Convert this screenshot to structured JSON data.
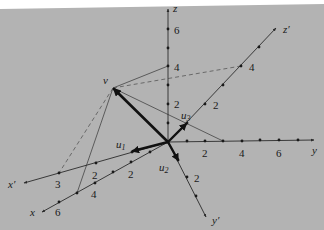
{
  "diagram": {
    "colors": {
      "background": "#b3b3b3",
      "axis": "#2a2a2a",
      "vector": "#111111",
      "construction": "#444444",
      "dashed": "#555555"
    },
    "origin": {
      "x": 168,
      "y": 142
    },
    "axes": [
      {
        "id": "z",
        "label": "z",
        "end": [
          168,
          9
        ],
        "ticks": [
          {
            "at": [
              168,
              104
            ],
            "label": "2"
          },
          {
            "at": [
              168,
              66
            ],
            "label": "4"
          },
          {
            "at": [
              168,
              29
            ],
            "label": "6"
          }
        ],
        "minor": [
          [
            168,
            123
          ],
          [
            168,
            85
          ],
          [
            168,
            48
          ]
        ]
      },
      {
        "id": "y",
        "label": "y",
        "end": [
          314,
          140
        ],
        "ticks": [
          {
            "at": [
              205,
              141
            ],
            "label": "2"
          },
          {
            "at": [
              242,
              141
            ],
            "label": "4"
          },
          {
            "at": [
              279,
              140
            ],
            "label": "6"
          }
        ],
        "minor": [
          [
            187,
            141
          ],
          [
            223,
            141
          ],
          [
            260,
            140
          ],
          [
            298,
            140
          ]
        ]
      },
      {
        "id": "x",
        "label": "x",
        "end": [
          42,
          212
        ],
        "ticks": [
          {
            "at": [
              131,
              162
            ],
            "label": "2"
          },
          {
            "at": [
              95,
              183
            ],
            "label": "4"
          },
          {
            "at": [
              59,
              202
            ],
            "label": "6"
          }
        ],
        "minor": [
          [
            150,
            152
          ],
          [
            113,
            172
          ],
          [
            77,
            193
          ]
        ]
      },
      {
        "id": "xp",
        "label": "x′",
        "end": [
          24,
          183
        ],
        "ticks": [
          {
            "at": [
              96,
              163
            ],
            "label": "2"
          },
          {
            "at": [
              59,
              173
            ],
            "label": "3"
          }
        ],
        "minor": [
          [
            132,
            152
          ]
        ]
      },
      {
        "id": "yp",
        "label": "y′",
        "end": [
          206,
          217
        ],
        "ticks": [
          {
            "at": [
              187,
              177
            ],
            "label": "2"
          }
        ],
        "minor": [
          [
            178,
            160
          ],
          [
            196,
            196
          ]
        ]
      },
      {
        "id": "zp",
        "label": "z′",
        "end": [
          276,
          28
        ],
        "ticks": [
          {
            "at": [
              205,
              104
            ],
            "label": "2"
          },
          {
            "at": [
              241,
              66
            ],
            "label": "4"
          }
        ],
        "minor": [
          [
            187,
            123
          ],
          [
            223,
            85
          ],
          [
            259,
            47
          ]
        ]
      }
    ],
    "vectors": {
      "v": {
        "label": "v",
        "tip": [
          113,
          88
        ]
      },
      "u1": {
        "label": "u",
        "sub": "1",
        "tip": [
          131,
          151
        ]
      },
      "u2": {
        "label": "u",
        "sub": "2",
        "tip": [
          178,
          161
        ]
      },
      "u3": {
        "label": "u",
        "sub": "3",
        "tip": [
          187,
          123
        ]
      }
    },
    "labels": {
      "v": "v",
      "u": "u",
      "u1_sub": "1",
      "u2_sub": "2",
      "u3_sub": "3",
      "z": "z",
      "y": "y",
      "x": "x",
      "xp": "x′",
      "yp": "y′",
      "zp": "z′",
      "z_2": "2",
      "z_4": "4",
      "z_6": "6",
      "y_2": "2",
      "y_4": "4",
      "y_6": "6",
      "x_2": "2",
      "x_4": "4",
      "x_6": "6",
      "xp_2": "2",
      "xp_3": "3",
      "yp_2": "2",
      "zp_2": "2",
      "zp_4": "4"
    }
  }
}
